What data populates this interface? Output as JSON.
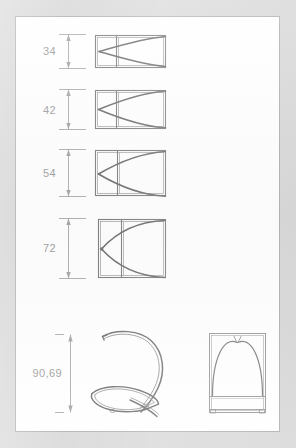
{
  "document": {
    "type": "technical-drawing",
    "title": "Lamp shade profile elevations",
    "page_background": "#ffffff",
    "canvas_background": "#d9d9d9",
    "page_border_color": "#b0b0b0",
    "line_color": "#7a7a7a",
    "curve_color": "#6e6e6e",
    "dimension_color": "#9b9b9b",
    "dimension_text_color": "#9b9b9b"
  },
  "dimensions": [
    {
      "id": "dim-34",
      "label": "34",
      "unit": ""
    },
    {
      "id": "dim-42",
      "label": "42",
      "unit": ""
    },
    {
      "id": "dim-54",
      "label": "54",
      "unit": ""
    },
    {
      "id": "dim-72",
      "label": "72",
      "unit": ""
    },
    {
      "id": "dim-9069",
      "label": "90,69",
      "unit": ""
    }
  ],
  "figures": [
    {
      "id": "profile-1",
      "name": "profile-elevation-34",
      "dimension_label": "34",
      "shape": "rectangle-with-lens-curves",
      "description": "Wide low rectangle with double border, vertical divider near left, two arcs meeting at left mid-height"
    },
    {
      "id": "profile-2",
      "name": "profile-elevation-42",
      "dimension_label": "42",
      "shape": "rectangle-with-lens-curves",
      "description": "Rectangle slightly taller than profile 1"
    },
    {
      "id": "profile-3",
      "name": "profile-elevation-54",
      "dimension_label": "54",
      "shape": "rectangle-with-lens-curves",
      "description": "Near square rectangle with lens curves"
    },
    {
      "id": "profile-4",
      "name": "profile-elevation-72",
      "dimension_label": "72",
      "shape": "rectangle-with-lens-curves",
      "description": "Square rectangle with widest lens curves"
    },
    {
      "id": "perspective-view",
      "name": "perspective-wire-loop",
      "dimension_label": "90,69",
      "shape": "3d-wire-loop",
      "description": "Perspective view of a looped wire frame resembling the letter Q"
    },
    {
      "id": "front-elevation",
      "name": "front-elevation-arch",
      "dimension_label": "",
      "shape": "arch-frame",
      "description": "Front elevation rectangle with two arcs forming a pointed arch and a lower shelf line with feet"
    }
  ]
}
